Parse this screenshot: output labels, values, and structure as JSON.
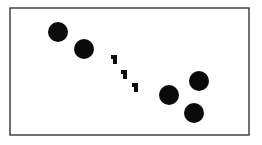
{
  "diagram": {
    "frame": {
      "x": 10,
      "y": 8,
      "width": 239,
      "height": 127,
      "stroke": "#444444"
    },
    "fill_color": "#0a0a0a",
    "circles": [
      {
        "cx": 58,
        "cy": 32,
        "r": 10
      },
      {
        "cx": 84,
        "cy": 49,
        "r": 10
      },
      {
        "cx": 169,
        "cy": 95,
        "r": 10
      },
      {
        "cx": 199,
        "cy": 81,
        "r": 10
      },
      {
        "cx": 194,
        "cy": 113,
        "r": 10
      }
    ],
    "small_marks": [
      {
        "x": 111,
        "y": 55,
        "w": 6,
        "h": 9
      },
      {
        "x": 121,
        "y": 70,
        "w": 6,
        "h": 9
      },
      {
        "x": 132,
        "y": 83,
        "w": 6,
        "h": 9
      }
    ]
  }
}
